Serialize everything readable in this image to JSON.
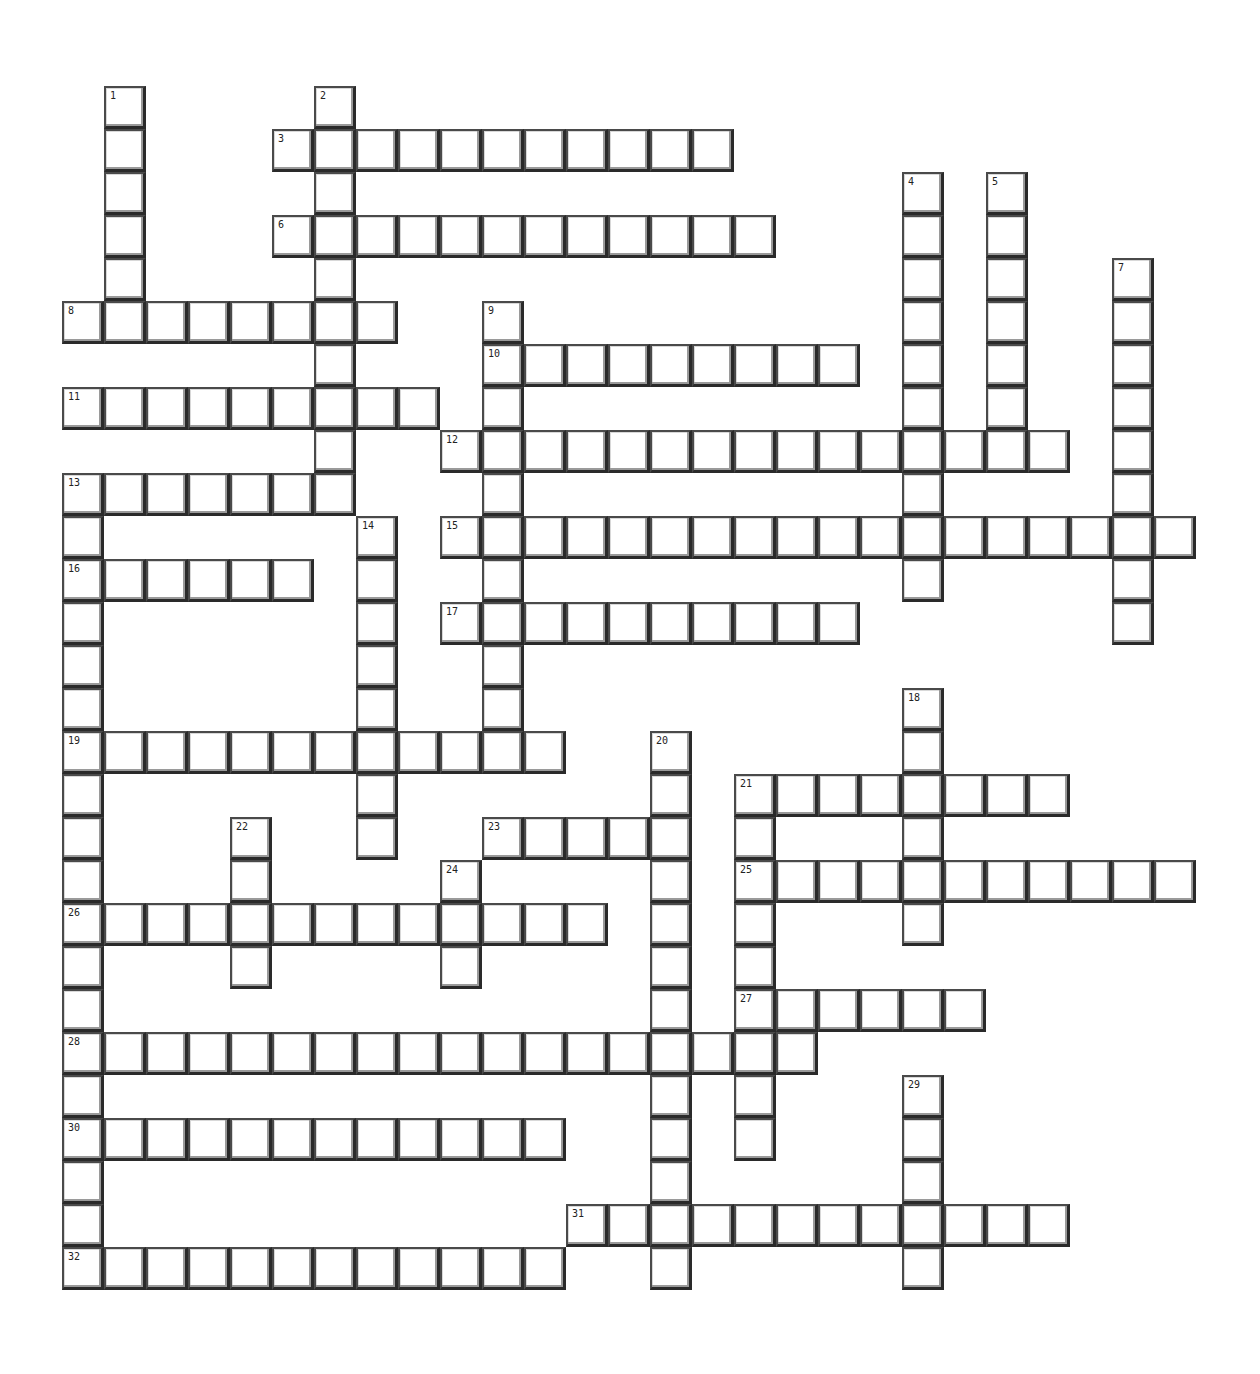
{
  "puzzle": {
    "cell_width": 42,
    "cell_height": 43,
    "origin_x": 62,
    "origin_y": 86,
    "words": [
      {
        "number": "1",
        "direction": "down",
        "col": 1,
        "row": 0,
        "length": 6
      },
      {
        "number": "2",
        "direction": "down",
        "col": 6,
        "row": 0,
        "length": 10
      },
      {
        "number": "3",
        "direction": "across",
        "col": 5,
        "row": 1,
        "length": 11
      },
      {
        "number": "4",
        "direction": "down",
        "col": 20,
        "row": 2,
        "length": 10
      },
      {
        "number": "5",
        "direction": "down",
        "col": 22,
        "row": 2,
        "length": 7
      },
      {
        "number": "6",
        "direction": "across",
        "col": 5,
        "row": 3,
        "length": 12
      },
      {
        "number": "7",
        "direction": "down",
        "col": 25,
        "row": 4,
        "length": 9
      },
      {
        "number": "8",
        "direction": "across",
        "col": 0,
        "row": 5,
        "length": 8
      },
      {
        "number": "9",
        "direction": "down",
        "col": 10,
        "row": 5,
        "length": 11
      },
      {
        "number": "10",
        "direction": "across",
        "col": 10,
        "row": 6,
        "length": 9
      },
      {
        "number": "11",
        "direction": "across",
        "col": 0,
        "row": 7,
        "length": 9
      },
      {
        "number": "12",
        "direction": "across",
        "col": 9,
        "row": 8,
        "length": 15
      },
      {
        "number": "13",
        "direction": "across",
        "col": 0,
        "row": 9,
        "length": 7
      },
      {
        "number": "13",
        "direction": "down",
        "col": 0,
        "row": 9,
        "length": 19
      },
      {
        "number": "14",
        "direction": "down",
        "col": 7,
        "row": 10,
        "length": 8
      },
      {
        "number": "15",
        "direction": "across",
        "col": 9,
        "row": 10,
        "length": 18
      },
      {
        "number": "16",
        "direction": "across",
        "col": 0,
        "row": 11,
        "length": 6
      },
      {
        "number": "17",
        "direction": "across",
        "col": 9,
        "row": 12,
        "length": 10
      },
      {
        "number": "18",
        "direction": "down",
        "col": 20,
        "row": 14,
        "length": 6
      },
      {
        "number": "19",
        "direction": "across",
        "col": 0,
        "row": 15,
        "length": 12
      },
      {
        "number": "20",
        "direction": "down",
        "col": 14,
        "row": 15,
        "length": 13
      },
      {
        "number": "21",
        "direction": "across",
        "col": 16,
        "row": 16,
        "length": 8
      },
      {
        "number": "21",
        "direction": "down",
        "col": 16,
        "row": 16,
        "length": 9
      },
      {
        "number": "22",
        "direction": "down",
        "col": 4,
        "row": 17,
        "length": 4
      },
      {
        "number": "23",
        "direction": "across",
        "col": 10,
        "row": 17,
        "length": 5
      },
      {
        "number": "24",
        "direction": "down",
        "col": 9,
        "row": 18,
        "length": 3
      },
      {
        "number": "25",
        "direction": "across",
        "col": 16,
        "row": 18,
        "length": 11
      },
      {
        "number": "26",
        "direction": "across",
        "col": 0,
        "row": 19,
        "length": 13
      },
      {
        "number": "27",
        "direction": "across",
        "col": 16,
        "row": 21,
        "length": 6
      },
      {
        "number": "28",
        "direction": "across",
        "col": 0,
        "row": 22,
        "length": 18
      },
      {
        "number": "29",
        "direction": "down",
        "col": 20,
        "row": 23,
        "length": 5
      },
      {
        "number": "30",
        "direction": "across",
        "col": 0,
        "row": 24,
        "length": 12
      },
      {
        "number": "31",
        "direction": "across",
        "col": 12,
        "row": 26,
        "length": 12
      },
      {
        "number": "32",
        "direction": "across",
        "col": 0,
        "row": 27,
        "length": 12
      }
    ]
  }
}
